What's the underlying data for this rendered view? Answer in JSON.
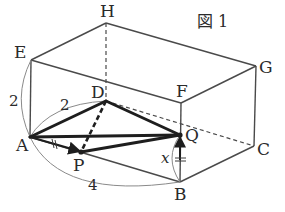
{
  "figure": {
    "title": "図 1",
    "vertices": {
      "A": {
        "label": "A",
        "x": 30,
        "y": 137
      },
      "B": {
        "label": "B",
        "x": 180,
        "y": 182
      },
      "C": {
        "label": "C",
        "x": 254,
        "y": 146
      },
      "D": {
        "label": "D",
        "x": 106,
        "y": 101
      },
      "E": {
        "label": "E",
        "x": 31,
        "y": 60
      },
      "F": {
        "label": "F",
        "x": 181,
        "y": 103
      },
      "G": {
        "label": "G",
        "x": 256,
        "y": 66
      },
      "H": {
        "label": "H",
        "x": 106,
        "y": 23
      },
      "P": {
        "label": "P",
        "x": 81,
        "y": 152
      },
      "Q": {
        "label": "Q",
        "x": 180,
        "y": 135
      }
    },
    "dimensions": {
      "AE": "2",
      "AD": "2",
      "AB": "4",
      "BQ": "x"
    },
    "colors": {
      "box_edge": "#4a4a4a",
      "bold_edge": "#1e1e1e",
      "arc": "#8a8a8a",
      "background": "#ffffff"
    }
  }
}
